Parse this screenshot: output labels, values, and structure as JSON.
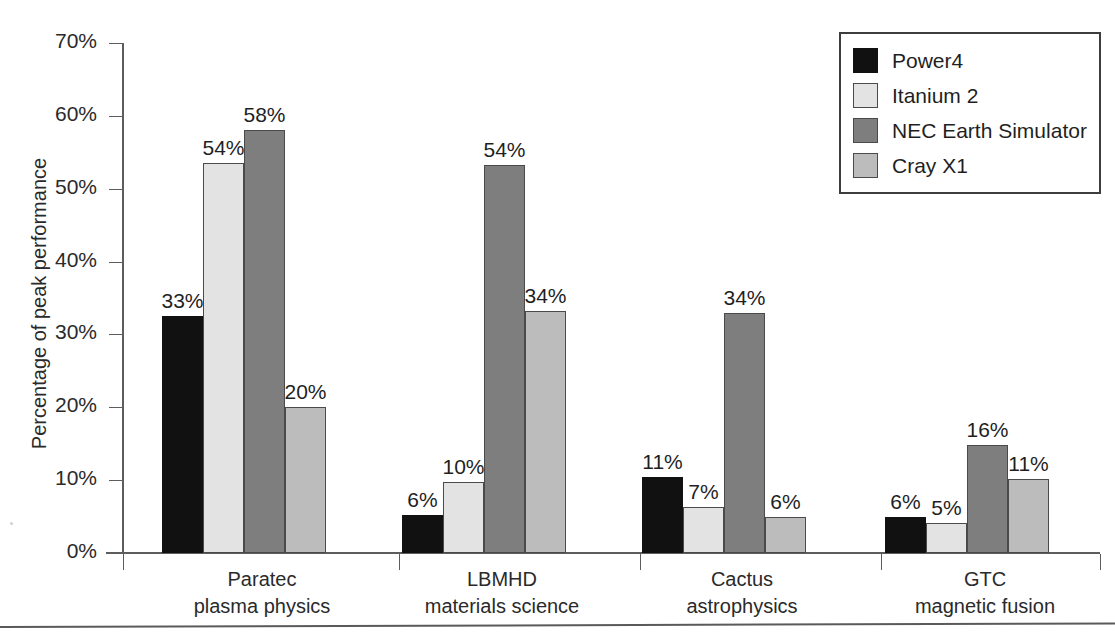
{
  "chart_data": {
    "type": "bar",
    "title": "",
    "xlabel": "",
    "ylabel": "Percentage of peak performance",
    "ylim": [
      0,
      70
    ],
    "ytick_labels": [
      "0%",
      "10%",
      "20%",
      "30%",
      "40%",
      "50%",
      "60%",
      "70%"
    ],
    "ytick_values": [
      0,
      10,
      20,
      30,
      40,
      50,
      60,
      70
    ],
    "grid": false,
    "legend_position": "top-right",
    "categories": [
      "Paratec",
      "LBMHD",
      "Cactus",
      "GTC"
    ],
    "category_sublabels": [
      "plasma physics",
      "materials science",
      "astrophysics",
      "magnetic fusion"
    ],
    "series": [
      {
        "name": "Power4",
        "color": "#111111",
        "values": [
          33,
          6,
          11,
          6
        ],
        "value_labels": [
          "33%",
          "6%",
          "11%",
          "6%"
        ]
      },
      {
        "name": "Itanium 2",
        "color": "#e3e3e3",
        "values": [
          54,
          10,
          7,
          5
        ],
        "value_labels": [
          "54%",
          "10%",
          "7%",
          "5%"
        ]
      },
      {
        "name": "NEC Earth Simulator",
        "color": "#7e7e7e",
        "values": [
          58,
          54,
          34,
          16
        ],
        "value_labels": [
          "58%",
          "54%",
          "34%",
          "16%"
        ]
      },
      {
        "name": "Cray X1",
        "color": "#bcbcbc",
        "values": [
          20,
          34,
          6,
          11
        ],
        "value_labels": [
          "20%",
          "34%",
          "6%",
          "11%"
        ]
      }
    ],
    "bar_render_values": [
      [
        32.5,
        53.5,
        58.0,
        20.0
      ],
      [
        5.2,
        9.8,
        53.3,
        33.2
      ],
      [
        10.5,
        6.3,
        33.0,
        5.0
      ],
      [
        5.0,
        4.1,
        14.8,
        10.2
      ]
    ]
  },
  "legend": {
    "items": [
      {
        "label": "Power4"
      },
      {
        "label": "Itanium 2"
      },
      {
        "label": "NEC Earth Simulator"
      },
      {
        "label": "Cray X1"
      }
    ]
  }
}
